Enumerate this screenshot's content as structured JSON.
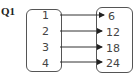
{
  "question": {
    "label": "Q1"
  },
  "domain_set": {
    "values": [
      "1",
      "2",
      "3",
      "4"
    ]
  },
  "range_set": {
    "values": [
      "6",
      "12",
      "18",
      "24"
    ]
  },
  "mapping": [
    {
      "from": "1",
      "to": "6"
    },
    {
      "from": "2",
      "to": "12"
    },
    {
      "from": "3",
      "to": "18"
    },
    {
      "from": "4",
      "to": "24"
    }
  ]
}
